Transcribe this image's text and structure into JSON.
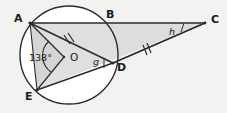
{
  "figure": {
    "type": "circle-geometry-diagram",
    "width": 227,
    "height": 113,
    "background_color": "#f2f2f0",
    "stroke_color": "#2b2b2b",
    "fill_shade": "#d9d9d9",
    "circle_fill": "#ffffff"
  },
  "points": {
    "A": {
      "label": "A",
      "x": 30,
      "y": 23,
      "label_x": 14,
      "label_y": 13
    },
    "B": {
      "label": "B",
      "x": 110,
      "y": 22,
      "label_x": 106,
      "label_y": 10
    },
    "C": {
      "label": "C",
      "x": 205,
      "y": 23,
      "label_x": 211,
      "label_y": 14
    },
    "D": {
      "label": "D",
      "x": 113,
      "y": 63,
      "label_x": 117,
      "label_y": 63
    },
    "E": {
      "label": "E",
      "x": 37,
      "y": 90,
      "label_x": 25,
      "label_y": 92
    },
    "O": {
      "label": "O",
      "x": 64,
      "y": 57,
      "label_x": 70,
      "label_y": 52
    }
  },
  "circle": {
    "center_x": 69,
    "center_y": 55,
    "radius": 49
  },
  "angles": [
    {
      "name": "central-angle-AOE",
      "label": "138°",
      "label_x": 29,
      "label_y": 53,
      "vertex": "O"
    },
    {
      "name": "angle-g-at-D",
      "label": "g",
      "label_x": 93,
      "label_y": 57,
      "vertex": "D"
    },
    {
      "name": "angle-h-at-C",
      "label": "h",
      "label_x": 169,
      "label_y": 27,
      "vertex": "C"
    }
  ],
  "tick_marks": [
    {
      "name": "tick-segment-AD",
      "count": 2,
      "x": 68,
      "y": 40
    },
    {
      "name": "tick-segment-DC",
      "count": 2,
      "x": 147,
      "y": 50
    }
  ],
  "segments": [
    {
      "name": "segment-A-C",
      "from": "A",
      "to": "C"
    },
    {
      "name": "segment-A-D",
      "from": "A",
      "to": "D"
    },
    {
      "name": "segment-A-O",
      "from": "A",
      "to": "O"
    },
    {
      "name": "segment-O-E",
      "from": "O",
      "to": "E"
    },
    {
      "name": "segment-E-D",
      "from": "E",
      "to": "D"
    },
    {
      "name": "segment-E-C",
      "from": "E",
      "to": "C"
    },
    {
      "name": "segment-A-E",
      "from": "A",
      "to": "E"
    }
  ]
}
